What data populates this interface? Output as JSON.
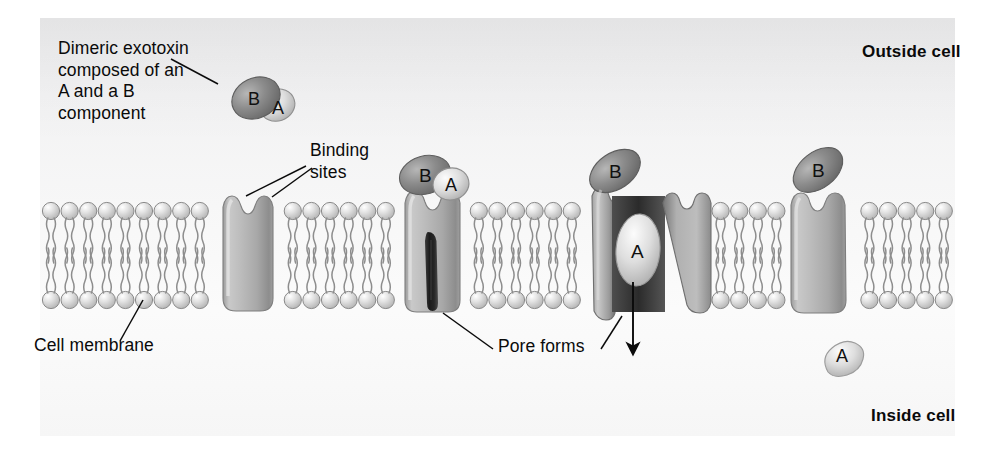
{
  "figure": {
    "title_alt": "Mechanism of dimeric A-B exotoxin entry through a cell membrane pore",
    "background_color": "#f4f4f5",
    "plate_color": "#efefef",
    "ink_color": "#0a0a0a"
  },
  "labels": {
    "exotoxin": "Dimeric exotoxin\ncomposed of an\nA and a B\ncomponent",
    "binding_sites": "Binding\nsites",
    "cell_membrane": "Cell membrane",
    "pore_forms": "Pore forms",
    "outside_cell": "Outside cell",
    "inside_cell": "Inside cell"
  },
  "subunits": {
    "b_label": "B",
    "a_label": "A",
    "b_color": "#8e8e8e",
    "a_color": "#d9d9d9"
  },
  "membrane": {
    "head_color": "#d3d3d3",
    "tail_color": "#8f8f8f",
    "head_count": 50,
    "top_head_y": 211,
    "bottom_head_y": 300
  },
  "receptors": [
    {
      "name": "receptor-unbound",
      "x": 222,
      "state": "unbound, two binding-site notches"
    },
    {
      "name": "receptor-bound-pore-forming",
      "x": 404,
      "state": "toxin bound, pore forming"
    },
    {
      "name": "receptor-open-translocating",
      "x": 586,
      "state": "open pore, A subunit translocating"
    },
    {
      "name": "receptor-closed-b-retained",
      "x": 772,
      "state": "pore closed, B retained"
    }
  ],
  "free_a_subunit": {
    "name": "released-a-subunit",
    "label": "A",
    "x": 845,
    "y": 358
  },
  "arrow": {
    "name": "translocation-arrow",
    "direction": "down",
    "x": 633,
    "y_start": 282,
    "y_end": 352
  }
}
